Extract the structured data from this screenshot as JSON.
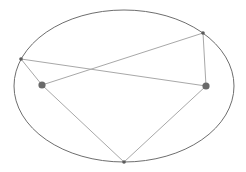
{
  "diagram": {
    "colors": {
      "ellipse": "#6e6e6e",
      "segment": "#a8a8a8",
      "focus": "#6a6a6a",
      "point": "#5a5a5a",
      "background": "#ffffff"
    },
    "foci": [
      {
        "id": "F1",
        "label": ""
      },
      {
        "id": "F2",
        "label": ""
      }
    ],
    "points_on_ellipse": [
      {
        "id": "P_left",
        "label": ""
      },
      {
        "id": "P_top_right",
        "label": ""
      },
      {
        "id": "P_bottom",
        "label": ""
      }
    ],
    "segments": [
      {
        "from": "P_left",
        "to": "F1"
      },
      {
        "from": "P_left",
        "to": "F2"
      },
      {
        "from": "P_top_right",
        "to": "F1"
      },
      {
        "from": "P_top_right",
        "to": "F2"
      },
      {
        "from": "P_bottom",
        "to": "F1"
      },
      {
        "from": "P_bottom",
        "to": "F2"
      }
    ]
  }
}
